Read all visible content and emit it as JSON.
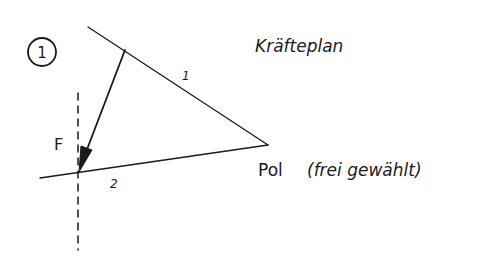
{
  "diagram": {
    "type": "force-polygon",
    "step_number": "1",
    "title": "Kräfteplan",
    "ink_color": "#1a1a1a",
    "background": "#ffffff",
    "labels": {
      "force": "F",
      "ray_1": "1",
      "ray_2": "2",
      "pole": "Pol",
      "pole_note": "(frei gewählt)"
    },
    "elements": {
      "pole_point": {
        "x": 268,
        "y": 145
      },
      "ray_1": {
        "from": {
          "x": 88,
          "y": 27
        },
        "to": {
          "x": 268,
          "y": 145
        }
      },
      "ray_2": {
        "from": {
          "x": 40,
          "y": 178
        },
        "to": {
          "x": 268,
          "y": 145
        }
      },
      "force_vector": {
        "from": {
          "x": 125,
          "y": 50
        },
        "to": {
          "x": 79,
          "y": 172
        }
      },
      "line_of_action": {
        "x": 78,
        "y_start": 93,
        "y_end": 250,
        "style": "dashed"
      }
    }
  }
}
